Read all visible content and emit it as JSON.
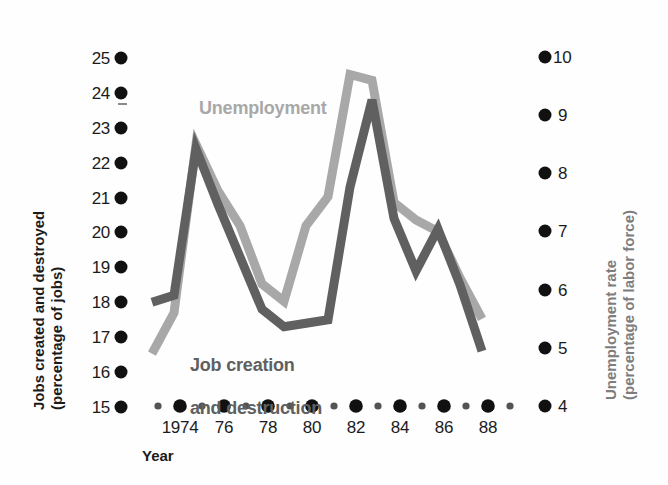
{
  "figure": {
    "background_color": "#fefefe",
    "stray_mark": {
      "present": true
    }
  },
  "chart_data": {
    "type": "line",
    "title": "",
    "subtitle": "",
    "xlabel": "Year",
    "x": [
      1973,
      1974,
      1975,
      1976,
      1977,
      1978,
      1979,
      1980,
      1981,
      1982,
      1983,
      1984,
      1985,
      1986,
      1987,
      1988
    ],
    "xtick_values": [
      1974,
      1976,
      1978,
      1980,
      1982,
      1984,
      1986,
      1988
    ],
    "xtick_labels": [
      "1974",
      "76",
      "78",
      "80",
      "82",
      "84",
      "86",
      "88"
    ],
    "xlim": [
      1973,
      1989
    ],
    "grid": false,
    "legend_position": "inline-annotations",
    "axes": [
      {
        "id": "left",
        "label": "Jobs created and destroyed\n(percentage of jobs)",
        "label_line1": "Jobs created and destroyed",
        "label_line2": "(percentage of jobs)",
        "ylim": [
          15,
          25
        ],
        "ticks": [
          25,
          24,
          23,
          22,
          21,
          20,
          19,
          18,
          17,
          16,
          15
        ],
        "tick_labels": [
          "25",
          "24",
          "23",
          "22",
          "21",
          "20",
          "19",
          "18",
          "17",
          "16",
          "15"
        ],
        "color": "#1b1b1b"
      },
      {
        "id": "right",
        "label": "Unemployment rate\n(percentage of labor force)",
        "label_line1": "Unemployment rate",
        "label_line2": "(percentage of labor force)",
        "ylim": [
          4,
          10
        ],
        "ticks": [
          10,
          9,
          8,
          7,
          6,
          5,
          4
        ],
        "tick_labels": [
          "10",
          "9",
          "8",
          "7",
          "6",
          "5",
          "4"
        ],
        "color": "#7d7d7d"
      }
    ],
    "series": [
      {
        "name": "Unemployment",
        "label": "Unemployment",
        "axis": "right",
        "color": "#a8a8a8",
        "units": "percentage of labor force",
        "values": [
          4.9,
          5.6,
          8.5,
          7.7,
          7.1,
          6.1,
          5.8,
          7.1,
          7.6,
          9.7,
          9.6,
          7.5,
          7.2,
          7.0,
          6.2,
          5.5
        ]
      },
      {
        "name": "Job creation and destruction",
        "label": "Job creation\nand destruction",
        "label_line1": "Job creation",
        "label_line2": "and destruction",
        "axis": "left",
        "color": "#606060",
        "units": "percentage of jobs",
        "values": [
          18.0,
          18.2,
          22.4,
          20.8,
          19.3,
          17.8,
          17.3,
          17.4,
          17.5,
          21.3,
          23.8,
          20.4,
          18.9,
          20.1,
          18.5,
          16.6
        ]
      }
    ]
  },
  "annotations": {
    "unemployment_label": "Unemployment",
    "jobs_label_line1": "Job creation",
    "jobs_label_line2": "and destruction"
  }
}
